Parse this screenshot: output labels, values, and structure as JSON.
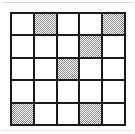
{
  "figure": {
    "type": "grid-pattern",
    "title": "",
    "rows": 5,
    "columns": 5,
    "colors": {
      "grid_line": "#1a1a1a",
      "cell_empty": "#ffffff",
      "cell_shaded": "#8a8a8a",
      "background": "#ffffff",
      "rule_line": "#d8d8d8"
    },
    "legend": {
      "empty_label": "empty",
      "shaded_label": "shaded"
    },
    "cells": [
      [
        {
          "row": 1,
          "col": 1,
          "state": "empty"
        },
        {
          "row": 1,
          "col": 2,
          "state": "shaded"
        },
        {
          "row": 1,
          "col": 3,
          "state": "empty"
        },
        {
          "row": 1,
          "col": 4,
          "state": "empty"
        },
        {
          "row": 1,
          "col": 5,
          "state": "shaded"
        }
      ],
      [
        {
          "row": 2,
          "col": 1,
          "state": "empty"
        },
        {
          "row": 2,
          "col": 2,
          "state": "empty"
        },
        {
          "row": 2,
          "col": 3,
          "state": "empty"
        },
        {
          "row": 2,
          "col": 4,
          "state": "shaded"
        },
        {
          "row": 2,
          "col": 5,
          "state": "empty"
        }
      ],
      [
        {
          "row": 3,
          "col": 1,
          "state": "empty"
        },
        {
          "row": 3,
          "col": 2,
          "state": "empty"
        },
        {
          "row": 3,
          "col": 3,
          "state": "shaded"
        },
        {
          "row": 3,
          "col": 4,
          "state": "empty"
        },
        {
          "row": 3,
          "col": 5,
          "state": "empty"
        }
      ],
      [
        {
          "row": 4,
          "col": 1,
          "state": "empty"
        },
        {
          "row": 4,
          "col": 2,
          "state": "empty"
        },
        {
          "row": 4,
          "col": 3,
          "state": "empty"
        },
        {
          "row": 4,
          "col": 4,
          "state": "empty"
        },
        {
          "row": 4,
          "col": 5,
          "state": "empty"
        }
      ],
      [
        {
          "row": 5,
          "col": 1,
          "state": "shaded"
        },
        {
          "row": 5,
          "col": 2,
          "state": "empty"
        },
        {
          "row": 5,
          "col": 3,
          "state": "empty"
        },
        {
          "row": 5,
          "col": 4,
          "state": "shaded"
        },
        {
          "row": 5,
          "col": 5,
          "state": "empty"
        }
      ]
    ],
    "shaded_count": 6,
    "empty_count": 19
  }
}
